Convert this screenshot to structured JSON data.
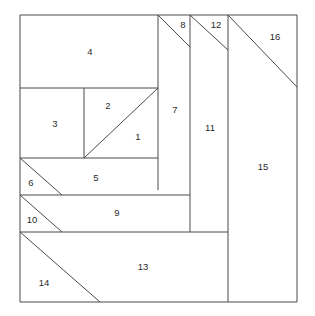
{
  "diagram": {
    "type": "line-diagram",
    "canvas": {
      "width": 315,
      "height": 316
    },
    "style": {
      "background_color": "#ffffff",
      "line_color": "#4a4a4a",
      "label_color": "#2b2b2b",
      "line_width": 1
    },
    "outer_border": {
      "x": 20,
      "y": 15,
      "width": 277,
      "height": 287
    },
    "pieces": [
      {
        "id": "1",
        "label": "1",
        "label_x": 138,
        "label_y": 137,
        "shape": "triangle"
      },
      {
        "id": "2",
        "label": "2",
        "label_x": 108,
        "label_y": 106,
        "shape": "triangle"
      },
      {
        "id": "3",
        "label": "3",
        "label_x": 55,
        "label_y": 124,
        "shape": "rectangle"
      },
      {
        "id": "4",
        "label": "4",
        "label_x": 90,
        "label_y": 52,
        "shape": "rectangle"
      },
      {
        "id": "5",
        "label": "5",
        "label_x": 96,
        "label_y": 178,
        "shape": "quadrilateral"
      },
      {
        "id": "6",
        "label": "6",
        "label_x": 31,
        "label_y": 183,
        "shape": "triangle"
      },
      {
        "id": "7",
        "label": "7",
        "label_x": 175,
        "label_y": 110,
        "shape": "rectangle"
      },
      {
        "id": "8",
        "label": "8",
        "label_x": 183,
        "label_y": 25,
        "shape": "triangle"
      },
      {
        "id": "9",
        "label": "9",
        "label_x": 117,
        "label_y": 213,
        "shape": "quadrilateral"
      },
      {
        "id": "10",
        "label": "10",
        "label_x": 32,
        "label_y": 220,
        "shape": "triangle"
      },
      {
        "id": "11",
        "label": "11",
        "label_x": 210,
        "label_y": 128,
        "shape": "rectangle"
      },
      {
        "id": "12",
        "label": "12",
        "label_x": 216,
        "label_y": 25,
        "shape": "triangle"
      },
      {
        "id": "13",
        "label": "13",
        "label_x": 143,
        "label_y": 267,
        "shape": "quadrilateral"
      },
      {
        "id": "14",
        "label": "14",
        "label_x": 44,
        "label_y": 283,
        "shape": "triangle"
      },
      {
        "id": "15",
        "label": "15",
        "label_x": 263,
        "label_y": 167,
        "shape": "quadrilateral"
      },
      {
        "id": "16",
        "label": "16",
        "label_x": 275,
        "label_y": 37,
        "shape": "triangle"
      }
    ],
    "segments": [
      {
        "name": "outer-top",
        "x1": 20,
        "y1": 15,
        "x2": 297,
        "y2": 15
      },
      {
        "name": "outer-right",
        "x1": 297,
        "y1": 15,
        "x2": 297,
        "y2": 302
      },
      {
        "name": "outer-bottom",
        "x1": 297,
        "y1": 302,
        "x2": 20,
        "y2": 302
      },
      {
        "name": "outer-left",
        "x1": 20,
        "y1": 302,
        "x2": 20,
        "y2": 15
      },
      {
        "name": "p4-bottom",
        "x1": 20,
        "y1": 88,
        "x2": 158,
        "y2": 88
      },
      {
        "name": "p4-right",
        "x1": 158,
        "y1": 15,
        "x2": 158,
        "y2": 190
      },
      {
        "name": "p3-right",
        "x1": 84,
        "y1": 88,
        "x2": 84,
        "y2": 158
      },
      {
        "name": "p12-diag",
        "x1": 84,
        "y1": 158,
        "x2": 158,
        "y2": 88
      },
      {
        "name": "p5-top",
        "x1": 20,
        "y1": 158,
        "x2": 158,
        "y2": 158
      },
      {
        "name": "p6-diag",
        "x1": 20,
        "y1": 158,
        "x2": 62,
        "y2": 195
      },
      {
        "name": "p5-bottom",
        "x1": 20,
        "y1": 195,
        "x2": 190,
        "y2": 195
      },
      {
        "name": "p10-diag",
        "x1": 20,
        "y1": 195,
        "x2": 62,
        "y2": 232
      },
      {
        "name": "p9-bottom",
        "x1": 20,
        "y1": 232,
        "x2": 228,
        "y2": 232
      },
      {
        "name": "p14-diag",
        "x1": 20,
        "y1": 232,
        "x2": 100,
        "y2": 302
      },
      {
        "name": "p7-right",
        "x1": 190,
        "y1": 15,
        "x2": 190,
        "y2": 232
      },
      {
        "name": "p8-diag",
        "x1": 158,
        "y1": 15,
        "x2": 190,
        "y2": 47
      },
      {
        "name": "p11-right",
        "x1": 228,
        "y1": 15,
        "x2": 228,
        "y2": 302
      },
      {
        "name": "p12-diag2",
        "x1": 190,
        "y1": 15,
        "x2": 228,
        "y2": 50
      },
      {
        "name": "p16-diag",
        "x1": 228,
        "y1": 15,
        "x2": 297,
        "y2": 87
      }
    ]
  }
}
